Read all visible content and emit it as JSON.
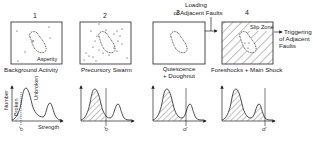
{
  "stages": [
    {
      "number": "1",
      "caption": "Background Activity",
      "box_label": "Asperity"
    },
    {
      "number": "2",
      "caption": "Precursory Swarm"
    },
    {
      "number": "3",
      "caption_line1": "Quiescence",
      "caption_line2": "+ Doughnut"
    },
    {
      "number": "4",
      "caption": "Foreshocks + Main Shock",
      "box_label": "Slip Zone"
    }
  ],
  "arrows": {
    "loading_line1": "Loading",
    "loading_line2": "of Adjacent Faults",
    "triggering_line1": "Triggering",
    "triggering_line2": "of Adjacent",
    "triggering_line3": "Faults"
  },
  "graphs": {
    "y_axis_label": "Number",
    "x_axis_label": "Strength",
    "broken_label": "Broken",
    "unbroken_label": "Unbroken",
    "stress_symbol": "σ̄"
  },
  "colors": {
    "ink": "#222222",
    "background": "#ffffff"
  }
}
